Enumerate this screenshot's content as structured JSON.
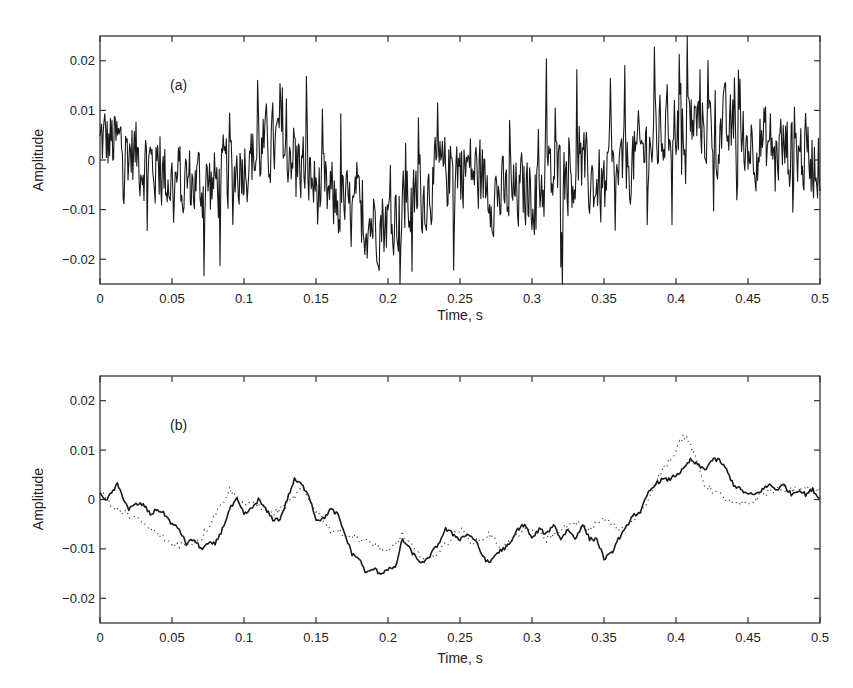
{
  "chart_data": [
    {
      "type": "line",
      "panel_label": "(a)",
      "title": "",
      "xlabel": "Time, s",
      "ylabel": "Amplitude",
      "xlim": [
        0,
        0.5
      ],
      "ylim": [
        -0.025,
        0.025
      ],
      "xticks": [
        "0",
        "0.05",
        "0.1",
        "0.15",
        "0.2",
        "0.25",
        "0.3",
        "0.35",
        "0.4",
        "0.45",
        "0.5"
      ],
      "yticks": [
        "0.02",
        "0.01",
        "0",
        "-0.01",
        "-0.02"
      ],
      "grid": false,
      "legend": null,
      "series": [
        {
          "name": "raw signal",
          "style": "solid",
          "description": "High-frequency noisy signal, amplitude mostly within ±0.025, slow trend: near +0.005 at start, around -0.01 between 0.15-0.25 s, rising to about +0.008 between 0.37-0.45 s, near 0 at 0.5 s",
          "trend_x": [
            0,
            0.02,
            0.05,
            0.08,
            0.1,
            0.13,
            0.15,
            0.18,
            0.2,
            0.22,
            0.25,
            0.28,
            0.3,
            0.33,
            0.35,
            0.37,
            0.4,
            0.43,
            0.45,
            0.48,
            0.5
          ],
          "trend_y": [
            0.004,
            0.002,
            -0.004,
            -0.005,
            0.0,
            0.004,
            -0.006,
            -0.012,
            -0.012,
            -0.008,
            0.0,
            -0.008,
            -0.006,
            -0.002,
            -0.006,
            0.0,
            0.008,
            0.006,
            0.004,
            0.002,
            0.0
          ]
        }
      ]
    },
    {
      "type": "line",
      "panel_label": "(b)",
      "title": "",
      "xlabel": "Time, s",
      "ylabel": "Amplitude",
      "xlim": [
        0,
        0.5
      ],
      "ylim": [
        -0.025,
        0.025
      ],
      "xticks": [
        "0",
        "0.05",
        "0.1",
        "0.15",
        "0.2",
        "0.25",
        "0.3",
        "0.35",
        "0.4",
        "0.45",
        "0.5"
      ],
      "yticks": [
        "0.02",
        "0.01",
        "0",
        "-0.01",
        "-0.02"
      ],
      "grid": false,
      "legend": null,
      "series": [
        {
          "name": "smoothed (solid)",
          "style": "solid",
          "x": [
            0,
            0.005,
            0.012,
            0.02,
            0.025,
            0.03,
            0.035,
            0.04,
            0.045,
            0.05,
            0.055,
            0.06,
            0.065,
            0.07,
            0.075,
            0.08,
            0.085,
            0.09,
            0.095,
            0.1,
            0.105,
            0.11,
            0.115,
            0.12,
            0.125,
            0.13,
            0.135,
            0.14,
            0.145,
            0.15,
            0.155,
            0.16,
            0.165,
            0.17,
            0.175,
            0.18,
            0.185,
            0.19,
            0.195,
            0.2,
            0.205,
            0.21,
            0.215,
            0.22,
            0.225,
            0.23,
            0.235,
            0.24,
            0.245,
            0.25,
            0.255,
            0.26,
            0.265,
            0.27,
            0.275,
            0.28,
            0.285,
            0.29,
            0.295,
            0.3,
            0.305,
            0.31,
            0.315,
            0.32,
            0.325,
            0.33,
            0.335,
            0.34,
            0.345,
            0.35,
            0.355,
            0.36,
            0.365,
            0.37,
            0.375,
            0.38,
            0.385,
            0.39,
            0.395,
            0.4,
            0.405,
            0.41,
            0.415,
            0.42,
            0.425,
            0.43,
            0.435,
            0.44,
            0.445,
            0.45,
            0.455,
            0.46,
            0.465,
            0.47,
            0.475,
            0.48,
            0.485,
            0.49,
            0.495,
            0.5
          ],
          "y": [
            0.001,
            0.0,
            0.003,
            -0.002,
            -0.001,
            -0.001,
            -0.003,
            -0.002,
            -0.003,
            -0.005,
            -0.006,
            -0.009,
            -0.008,
            -0.01,
            -0.009,
            -0.009,
            -0.006,
            -0.002,
            0.0,
            -0.003,
            -0.002,
            0.0,
            -0.002,
            -0.004,
            -0.004,
            0.0,
            0.004,
            0.003,
            0.001,
            -0.004,
            -0.004,
            -0.002,
            -0.003,
            -0.007,
            -0.011,
            -0.012,
            -0.015,
            -0.014,
            -0.015,
            -0.014,
            -0.014,
            -0.008,
            -0.01,
            -0.012,
            -0.013,
            -0.011,
            -0.009,
            -0.006,
            -0.007,
            -0.008,
            -0.007,
            -0.008,
            -0.011,
            -0.013,
            -0.011,
            -0.01,
            -0.009,
            -0.006,
            -0.005,
            -0.008,
            -0.006,
            -0.007,
            -0.005,
            -0.008,
            -0.006,
            -0.008,
            -0.005,
            -0.008,
            -0.008,
            -0.012,
            -0.011,
            -0.008,
            -0.006,
            -0.003,
            -0.003,
            0.001,
            0.003,
            0.004,
            0.004,
            0.005,
            0.006,
            0.008,
            0.007,
            0.006,
            0.008,
            0.008,
            0.006,
            0.003,
            0.002,
            0.001,
            0.001,
            0.002,
            0.003,
            0.002,
            0.003,
            0.001,
            0.002,
            0.001,
            0.002,
            0.0
          ]
        },
        {
          "name": "reference (dotted)",
          "style": "dotted",
          "x": [
            0,
            0.01,
            0.02,
            0.03,
            0.04,
            0.05,
            0.06,
            0.07,
            0.08,
            0.09,
            0.1,
            0.11,
            0.12,
            0.13,
            0.14,
            0.15,
            0.16,
            0.17,
            0.18,
            0.19,
            0.2,
            0.21,
            0.22,
            0.23,
            0.24,
            0.25,
            0.26,
            0.27,
            0.28,
            0.29,
            0.3,
            0.31,
            0.32,
            0.33,
            0.34,
            0.35,
            0.36,
            0.37,
            0.38,
            0.39,
            0.4,
            0.405,
            0.41,
            0.42,
            0.43,
            0.44,
            0.45,
            0.46,
            0.47,
            0.48,
            0.49,
            0.5
          ],
          "y": [
            0.002,
            -0.002,
            -0.003,
            -0.005,
            -0.007,
            -0.009,
            -0.009,
            -0.008,
            -0.003,
            0.002,
            -0.001,
            -0.001,
            -0.003,
            -0.001,
            0.002,
            -0.002,
            -0.006,
            -0.007,
            -0.008,
            -0.009,
            -0.011,
            -0.007,
            -0.011,
            -0.012,
            -0.009,
            -0.006,
            -0.009,
            -0.007,
            -0.01,
            -0.007,
            -0.006,
            -0.008,
            -0.006,
            -0.005,
            -0.006,
            -0.004,
            -0.006,
            -0.004,
            -0.001,
            0.006,
            0.01,
            0.013,
            0.011,
            0.003,
            0.001,
            -0.001,
            -0.001,
            0.001,
            0.002,
            0.002,
            0.002,
            0.002
          ]
        }
      ]
    }
  ],
  "panels": {
    "a": {
      "label": "(a)",
      "xlabel": "Time, s",
      "ylabel": "Amplitude"
    },
    "b": {
      "label": "(b)",
      "xlabel": "Time, s",
      "ylabel": "Amplitude"
    }
  },
  "colors": {
    "line": "#1a1a1a",
    "frame": "#333333",
    "dotted": "#444444"
  }
}
